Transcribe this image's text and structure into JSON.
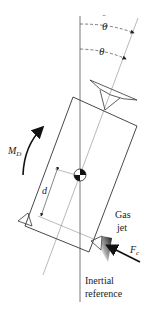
{
  "figure": {
    "labels": {
      "theta": "θ",
      "theta_cmd": "θ",
      "theta_cmd_accent": "¨",
      "moment_main": "M",
      "moment_sub": "D",
      "distance": "d",
      "gas_line1": "Gas",
      "gas_line2": "jet",
      "force_main": "F",
      "force_sub": "c",
      "inertial_line1": "Inertial",
      "inertial_line2": "reference"
    },
    "colors": {
      "line": "#3a3a3a",
      "light_line": "#8a8a8a",
      "text": "#1a1a1a",
      "cg_fill": "#111111"
    }
  }
}
